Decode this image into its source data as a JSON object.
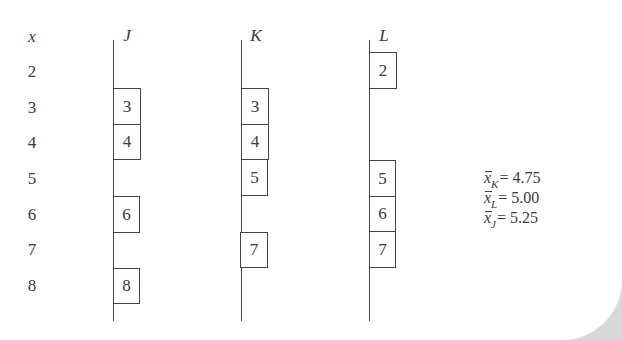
{
  "diagram": {
    "x_header": "x",
    "x_values": [
      "2",
      "3",
      "4",
      "5",
      "6",
      "7",
      "8"
    ],
    "columns": [
      {
        "name": "J",
        "values": [
          "3",
          "4",
          "6",
          "8"
        ],
        "rows": [
          1,
          2,
          4,
          6
        ]
      },
      {
        "name": "K",
        "values": [
          "3",
          "4",
          "5",
          "7"
        ],
        "rows": [
          1,
          2,
          3,
          5
        ]
      },
      {
        "name": "L",
        "values": [
          "2",
          "5",
          "6",
          "7"
        ],
        "rows": [
          0,
          3,
          4,
          5
        ]
      }
    ],
    "means": [
      {
        "var": "x",
        "sub": "K",
        "eq": "= 4.75"
      },
      {
        "var": "x",
        "sub": "L",
        "eq": "= 5.00"
      },
      {
        "var": "x",
        "sub": "J",
        "eq": "= 5.25"
      }
    ]
  },
  "colors": {
    "ink": "#3a3a3a",
    "line": "#444444",
    "page": "#ffffff",
    "curl": "#d9d9d9"
  }
}
